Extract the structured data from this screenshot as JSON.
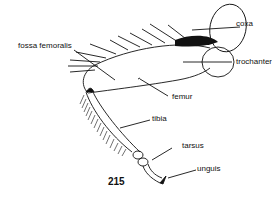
{
  "figure": {
    "number": "215",
    "labels": {
      "coxa": "coxa",
      "trochanter": "trochanter",
      "fossa_femoralis": "fossa femoralis",
      "femur": "femur",
      "tibia": "tibia",
      "tarsus": "tarsus",
      "unguis": "unguis"
    },
    "colors": {
      "ink": "#111111",
      "background": "#ffffff"
    }
  }
}
